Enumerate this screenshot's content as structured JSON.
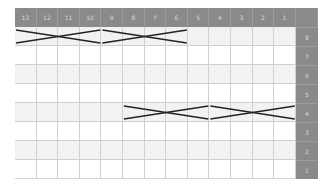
{
  "columns": [
    "13",
    "12",
    "11",
    "10",
    "9",
    "8",
    "7",
    "6",
    "5",
    "4",
    "3",
    "2",
    "1"
  ],
  "rows": [
    "8",
    "7",
    "6",
    "5",
    "4",
    "3",
    "2",
    "1"
  ],
  "shaded_rows": [
    "8",
    "6",
    "4",
    "2"
  ],
  "colors": {
    "header": "#8a8a8a",
    "header_text": "#d8d8d8",
    "shade": "#f2f2f2",
    "grid": "#d0d0d0",
    "line": "#222222"
  },
  "crossings": [
    {
      "row": "8",
      "from_col": "13",
      "to_col": "10"
    },
    {
      "row": "8",
      "from_col": "9",
      "to_col": "6"
    },
    {
      "row": "4",
      "from_col": "8",
      "to_col": "5"
    },
    {
      "row": "4",
      "from_col": "4",
      "to_col": "1"
    }
  ]
}
